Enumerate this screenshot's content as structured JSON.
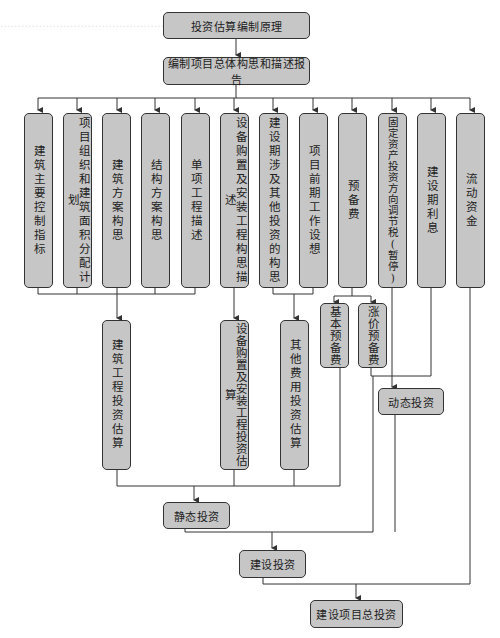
{
  "diagram": {
    "type": "flowchart",
    "title_node": "投资估算编制原理",
    "nodes": {
      "root": "投资估算编制原理",
      "report": "编制项目总体构思和描述报告",
      "c1": "建筑主要控制指标",
      "c2": "项目组织和建筑面积分配计划",
      "c3": "建筑方案构思",
      "c4": "结构方案构思",
      "c5": "单项工程描述",
      "c6": "设备购置及安装工程构思描述",
      "c7": "建设期涉及其他投资的构思",
      "c8": "项目前期工作设想",
      "c9": "预备费",
      "c10": "固定资产投资方向调节税(暂停)",
      "c11": "建设期利息",
      "c12": "流动资金",
      "building_est": "建筑工程投资估算",
      "equip_est": "设备购置及安装工程投资估算",
      "other_est": "其他费用投资估算",
      "basic_reserve": "基本预备费",
      "price_reserve": "涨价预备费",
      "static": "静态投资",
      "dynamic": "动态投资",
      "construction": "建设投资",
      "total": "建设项目总投资"
    },
    "edges": [
      [
        "root",
        "report"
      ],
      [
        "report",
        "c1"
      ],
      [
        "report",
        "c2"
      ],
      [
        "report",
        "c3"
      ],
      [
        "report",
        "c4"
      ],
      [
        "report",
        "c5"
      ],
      [
        "report",
        "c6"
      ],
      [
        "report",
        "c7"
      ],
      [
        "report",
        "c8"
      ],
      [
        "report",
        "c9"
      ],
      [
        "report",
        "c10"
      ],
      [
        "report",
        "c11"
      ],
      [
        "report",
        "c12"
      ],
      [
        "c1",
        "building_est"
      ],
      [
        "c2",
        "building_est"
      ],
      [
        "c3",
        "building_est"
      ],
      [
        "c4",
        "building_est"
      ],
      [
        "c5",
        "building_est"
      ],
      [
        "c6",
        "equip_est"
      ],
      [
        "c7",
        "other_est"
      ],
      [
        "c8",
        "other_est"
      ],
      [
        "c9",
        "basic_reserve"
      ],
      [
        "c9",
        "price_reserve"
      ],
      [
        "building_est",
        "static"
      ],
      [
        "equip_est",
        "static"
      ],
      [
        "other_est",
        "static"
      ],
      [
        "basic_reserve",
        "static"
      ],
      [
        "price_reserve",
        "dynamic"
      ],
      [
        "c10",
        "dynamic"
      ],
      [
        "c11",
        "dynamic"
      ],
      [
        "static",
        "construction"
      ],
      [
        "dynamic",
        "construction"
      ],
      [
        "construction",
        "total"
      ],
      [
        "c12",
        "total"
      ]
    ],
    "colors": {
      "box_fill": "#c6c6c6",
      "box_border": "#333333",
      "line": "#333333"
    }
  }
}
